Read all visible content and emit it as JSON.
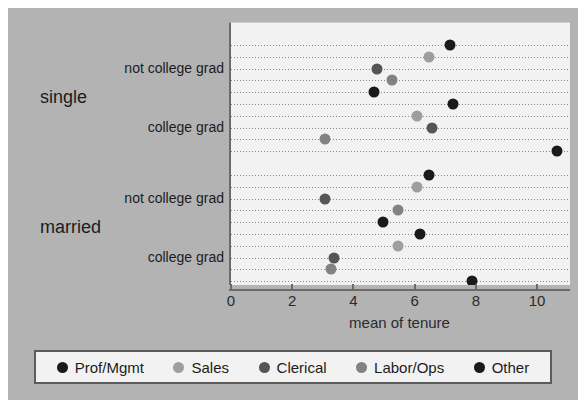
{
  "chart_data": {
    "type": "scatter",
    "title": "",
    "xlabel": "mean of tenure",
    "ylabel": "",
    "xlim": [
      0,
      11.15
    ],
    "xticks": [
      0,
      2,
      4,
      6,
      8,
      10
    ],
    "xticklabels": [
      "0",
      "2",
      "4",
      "6",
      "8",
      "10"
    ],
    "grid": true,
    "legend_position": "bottom",
    "legend": [
      "Prof/Mgmt",
      "Sales",
      "Clerical",
      "Labor/Ops",
      "Other"
    ],
    "colors": {
      "Prof/Mgmt": "#1a1a1a",
      "Sales": "#9e9e9e",
      "Clerical": "#555555",
      "Labor/Ops": "#828282",
      "Other": "#1a1a1a",
      "panel_background": "#f2f2f2",
      "figure_background": "#b3b3b3",
      "axis": "#6b6b6b",
      "gridline": "#8a8a8a"
    },
    "groups": [
      {
        "group": "single",
        "subgroups": [
          {
            "label": "not college grad",
            "points": [
              {
                "series": "Prof/Mgmt",
                "value": 7.1
              },
              {
                "series": "Sales",
                "value": 6.4
              },
              {
                "series": "Clerical",
                "value": 4.7
              },
              {
                "series": "Labor/Ops",
                "value": 5.2
              },
              {
                "series": "Other",
                "value": 4.6
              }
            ]
          },
          {
            "label": "college grad",
            "points": [
              {
                "series": "Prof/Mgmt",
                "value": 7.2
              },
              {
                "series": "Sales",
                "value": 6.0
              },
              {
                "series": "Clerical",
                "value": 6.5
              },
              {
                "series": "Labor/Ops",
                "value": 3.0
              },
              {
                "series": "Other",
                "value": 10.6
              }
            ]
          }
        ]
      },
      {
        "group": "married",
        "subgroups": [
          {
            "label": "not college grad",
            "points": [
              {
                "series": "Prof/Mgmt",
                "value": 6.4
              },
              {
                "series": "Sales",
                "value": 6.0
              },
              {
                "series": "Clerical",
                "value": 3.0
              },
              {
                "series": "Labor/Ops",
                "value": 5.4
              },
              {
                "series": "Other",
                "value": 4.9
              }
            ]
          },
          {
            "label": "college grad",
            "points": [
              {
                "series": "Prof/Mgmt",
                "value": 6.1
              },
              {
                "series": "Sales",
                "value": 5.4
              },
              {
                "series": "Clerical",
                "value": 3.3
              },
              {
                "series": "Labor/Ops",
                "value": 3.2
              },
              {
                "series": "Other",
                "value": 7.8
              }
            ]
          }
        ]
      }
    ]
  }
}
